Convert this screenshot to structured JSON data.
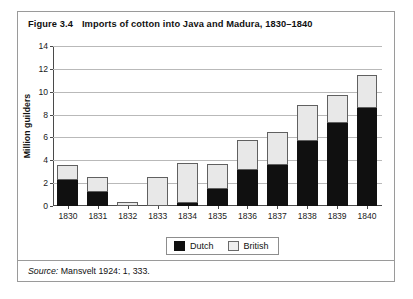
{
  "figure": {
    "number": "Figure 3.4",
    "title": "Imports of cotton into Java and Madura, 1830–1840"
  },
  "source": {
    "label": "Source:",
    "citation": " Mansvelt 1924: 1, 333."
  },
  "legend": {
    "items": [
      {
        "label": "Dutch",
        "color": "#101010",
        "name": "dutch"
      },
      {
        "label": "British",
        "color": "#e8e8e8",
        "name": "british"
      }
    ]
  },
  "chart_data": {
    "type": "bar",
    "title": "Imports of cotton into Java and Madura, 1830–1840",
    "subtitle": "",
    "xlabel": "",
    "ylabel": "Million guilders",
    "stacked": true,
    "grid": true,
    "legend_position": "bottom",
    "ylim": [
      0,
      14
    ],
    "yticks": [
      0,
      2,
      4,
      6,
      8,
      10,
      12,
      14
    ],
    "ytick_labels": [
      "0",
      "2",
      "4",
      "6",
      "8",
      "10",
      "12",
      "14"
    ],
    "categories": [
      "1830",
      "1831",
      "1832",
      "1833",
      "1834",
      "1835",
      "1836",
      "1837",
      "1838",
      "1839",
      "1840"
    ],
    "series": [
      {
        "name": "Dutch",
        "color": "#101010",
        "values": [
          2.3,
          1.25,
          0.0,
          0.0,
          0.3,
          1.45,
          3.15,
          3.55,
          5.65,
          7.25,
          8.6
        ]
      },
      {
        "name": "British",
        "color": "#e8e8e8",
        "values": [
          1.25,
          1.25,
          0.35,
          2.55,
          3.45,
          2.2,
          2.6,
          2.9,
          3.15,
          2.5,
          2.9
        ]
      }
    ],
    "totals": [
      3.55,
      2.5,
      0.35,
      2.55,
      3.75,
      3.65,
      5.75,
      6.45,
      8.8,
      9.75,
      11.5
    ]
  }
}
